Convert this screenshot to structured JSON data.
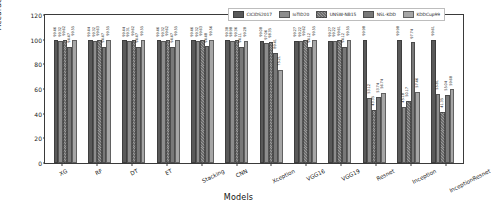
{
  "chart_data": {
    "type": "bar",
    "title": "",
    "xlabel": "Models",
    "ylabel": "Accuracy",
    "ylim": [
      0,
      120
    ],
    "yticks": [
      0,
      20,
      40,
      60,
      80,
      100,
      120
    ],
    "grid": false,
    "legend_position": "top-right",
    "categories": [
      "XG",
      "RF",
      "DT",
      "ET",
      "Stacking",
      "CNN",
      "Xception",
      "VGG16",
      "VGG19",
      "Resnet",
      "Inception",
      "InceptionResnet"
    ],
    "series": [
      {
        "name": "CICIDS2017",
        "color": "#595959",
        "values": [
          99.46,
          99.44,
          99.44,
          99.46,
          99.46,
          99.38,
          99.08,
          99.27,
          99.27,
          99.98,
          99.98,
          99.61
        ]
      },
      {
        "name": "IoTID20",
        "color": "#8d8d8d",
        "values": [
          99.32,
          99.32,
          99.31,
          99.32,
          99.32,
          98.98,
          97.06,
          99.22,
          99.22,
          53.12,
          45.18,
          55.81
        ]
      },
      {
        "name": "UNSW-NB15",
        "color": "#6f6f6f",
        "values": [
          99.62,
          99.63,
          99.62,
          99.62,
          99.63,
          99.36,
          98.35,
          99.62,
          99.61,
          43.35,
          50.17,
          41.35
        ]
      },
      {
        "name": "NSL-KDD",
        "color": "#787878",
        "values": [
          94.47,
          94.47,
          94.47,
          94.47,
          94.48,
          94.11,
          89.41,
          94.12,
          94.12,
          53.74,
          97.74,
          55.04
        ]
      },
      {
        "name": "KDDCup99",
        "color": "#a6a6a6",
        "values": [
          99.55,
          99.55,
          99.55,
          99.55,
          99.56,
          99.28,
          75.21,
          99.55,
          99.55,
          56.74,
          57.46,
          59.68
        ]
      }
    ]
  },
  "axes": {
    "ylabel": "Accuracy",
    "xlabel": "Models",
    "ytick_labels": [
      "0",
      "20",
      "40",
      "60",
      "80",
      "100",
      "120"
    ],
    "xtick_labels": [
      "XG",
      "RF",
      "DT",
      "ET",
      "Stacking",
      "CNN",
      "Xception",
      "VGG16",
      "VGG19",
      "Resnet",
      "Inception",
      "InceptionResnet"
    ]
  },
  "legend": {
    "items": [
      {
        "label": "CICIDS2017"
      },
      {
        "label": "IoTID20"
      },
      {
        "label": "UNSW-NB15"
      },
      {
        "label": "NSL-KDD"
      },
      {
        "label": "KDDCup99"
      }
    ]
  }
}
